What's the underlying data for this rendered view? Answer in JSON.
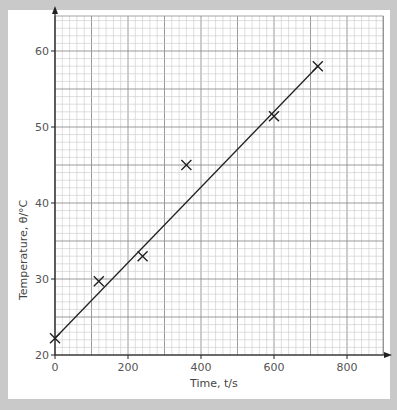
{
  "chart_data": {
    "type": "scatter",
    "title": "",
    "xlabel": "Time, t/s",
    "ylabel": "Temperature, θ/°C",
    "xlim": [
      0,
      900
    ],
    "ylim": [
      20,
      65
    ],
    "x_ticks": [
      "0",
      "200",
      "400",
      "600",
      "800"
    ],
    "y_ticks": [
      "20",
      "30",
      "40",
      "50",
      "60"
    ],
    "grid": true,
    "series": [
      {
        "name": "measurements",
        "marker": "x",
        "points": [
          {
            "x": 0,
            "y": 22.2
          },
          {
            "x": 120,
            "y": 29.7
          },
          {
            "x": 240,
            "y": 33.0
          },
          {
            "x": 360,
            "y": 45.0
          },
          {
            "x": 600,
            "y": 51.4
          },
          {
            "x": 720,
            "y": 58.0
          }
        ]
      },
      {
        "name": "line of best fit",
        "type": "line",
        "points": [
          {
            "x": 0,
            "y": 22.2
          },
          {
            "x": 720,
            "y": 58.0
          }
        ]
      }
    ],
    "legend": null
  },
  "colors": {
    "background": "#c9c9c9",
    "panel": "#ffffff",
    "grid_minor": "#c8c8c8",
    "grid_major": "#8f8f8f",
    "ink": "#222222"
  }
}
